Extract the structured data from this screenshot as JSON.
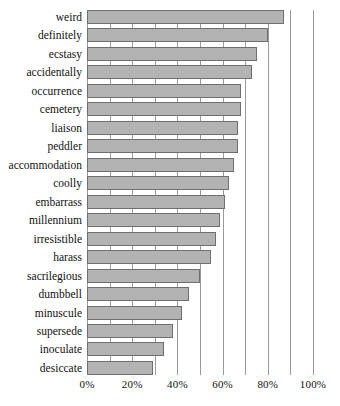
{
  "chart_data": {
    "type": "bar",
    "orientation": "horizontal",
    "title": "",
    "subtitle": "",
    "xlabel": "",
    "ylabel": "",
    "xlim": [
      0,
      100
    ],
    "grid": true,
    "legend": null,
    "x_tick_labels": [
      "0%",
      "20%",
      "40%",
      "60%",
      "80%",
      "100%"
    ],
    "x_tick_values": [
      0,
      20,
      40,
      60,
      80,
      100
    ],
    "gridline_values": [
      0,
      10,
      20,
      30,
      40,
      50,
      60,
      70,
      80,
      90,
      100
    ],
    "categories": [
      "weird",
      "definitely",
      "ecstasy",
      "accidentally",
      "occurrence",
      "cemetery",
      "liaison",
      "peddler",
      "accommodation",
      "coolly",
      "embarrass",
      "millennium",
      "irresistible",
      "harass",
      "sacrilegious",
      "dumbbell",
      "minuscule",
      "supersede",
      "inoculate",
      "desiccate"
    ],
    "values": [
      87,
      80,
      75,
      73,
      68,
      68,
      67,
      67,
      65,
      63,
      61,
      59,
      57,
      55,
      50,
      45,
      42,
      38,
      34,
      29
    ],
    "bar_color": "#b3b3b3",
    "bar_edge_color": "#6f6f6f",
    "grid_color": "#9a9a9a"
  }
}
